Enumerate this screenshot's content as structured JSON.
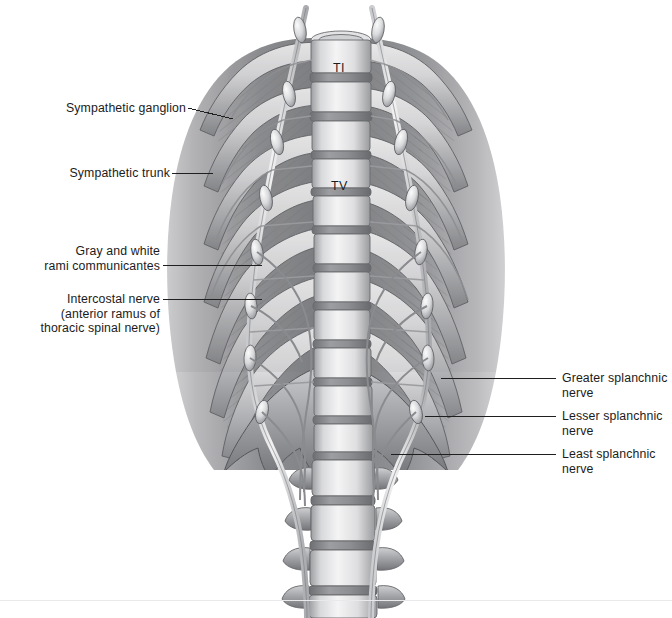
{
  "figure": {
    "view": "anterior view of posterior thoracic wall",
    "background_color": "#ffffff",
    "ink_color": "#1b1b1b",
    "leader_color": "#1f1f1f",
    "footer_rule_color": "#e9e9ec"
  },
  "labels": {
    "left": [
      {
        "name": "sympathetic-ganglion",
        "lines": [
          "Sympathetic ganglion"
        ],
        "text": "Sympathetic ganglion",
        "text_right_x": 186,
        "text_center_y": 108,
        "leader": {
          "x1": 188,
          "y1": 108,
          "x2": 233,
          "y2": 119
        }
      },
      {
        "name": "sympathetic-trunk",
        "lines": [
          "Sympathetic trunk"
        ],
        "text": "Sympathetic trunk",
        "text_right_x": 170,
        "text_center_y": 173,
        "leader": {
          "x1": 172,
          "y1": 173,
          "x2": 213,
          "y2": 173
        }
      },
      {
        "name": "gray-and-white-rami-communicantes",
        "lines": [
          "Gray and white",
          "rami communicantes"
        ],
        "text": "Gray and white\nrami communicantes",
        "text_right_x": 160,
        "text_center_y": 258,
        "leader": {
          "x1": 163,
          "y1": 265,
          "x2": 262,
          "y2": 265
        }
      },
      {
        "name": "intercostal-nerve",
        "lines": [
          "Intercostal nerve",
          "(anterior ramus of",
          "thoracic spinal nerve)"
        ],
        "text": "Intercostal nerve\n(anterior ramus of\nthoracic spinal nerve)",
        "text_right_x": 160,
        "text_center_y": 311,
        "leader": {
          "x1": 163,
          "y1": 299,
          "x2": 262,
          "y2": 299
        }
      }
    ],
    "right": [
      {
        "name": "greater-splanchnic-nerve",
        "lines": [
          "Greater splanchnic",
          "nerve"
        ],
        "text": "Greater splanchnic\nnerve",
        "text_left_x": 562,
        "text_top_y": 371,
        "leader": {
          "x1": 556,
          "y1": 378,
          "x2": 441,
          "y2": 378
        }
      },
      {
        "name": "lesser-splanchnic-nerve",
        "lines": [
          "Lesser splanchnic",
          "nerve"
        ],
        "text": "Lesser splanchnic\nnerve",
        "text_left_x": 562,
        "text_top_y": 409,
        "leader": {
          "x1": 556,
          "y1": 416,
          "x2": 425,
          "y2": 416
        }
      },
      {
        "name": "least-splanchnic-nerve",
        "lines": [
          "Least splanchnic",
          "nerve"
        ],
        "text": "Least splanchnic\nnerve",
        "text_left_x": 562,
        "text_top_y": 447,
        "leader": {
          "x1": 556,
          "y1": 454,
          "x2": 391,
          "y2": 454
        }
      }
    ]
  },
  "vertebra_labels": [
    {
      "name": "vertebra-T1",
      "text": "TI",
      "x": 341,
      "y": 68
    },
    {
      "name": "vertebra-T5",
      "text": "TV",
      "x": 340,
      "y": 186
    }
  ],
  "footer": {
    "rule_y": 600
  }
}
